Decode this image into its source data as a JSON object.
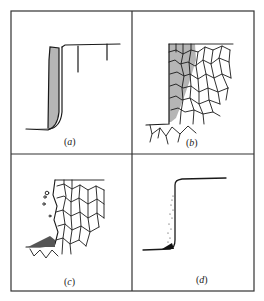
{
  "figure": {
    "panels": [
      {
        "id": "a",
        "label": "(a)",
        "letter": "a",
        "description": "Step profile with shaded vertical layer along the wall and short vertical cracks from top surface"
      },
      {
        "id": "b",
        "label": "(b)",
        "letter": "b",
        "description": "Step with polygonal grain network; shaded grains near the wall"
      },
      {
        "id": "c",
        "label": "(c)",
        "letter": "c",
        "description": "Step with polygonal grain network, detached particles and debris pile at base"
      },
      {
        "id": "d",
        "label": "(d)",
        "letter": "d",
        "description": "Smooth step profile with scattered dots along the wall and dark deposit at base"
      }
    ],
    "colors": {
      "line": "#1a1a1a",
      "shade": "#b5b5b5",
      "border": "#333333",
      "background": "#ffffff"
    }
  }
}
